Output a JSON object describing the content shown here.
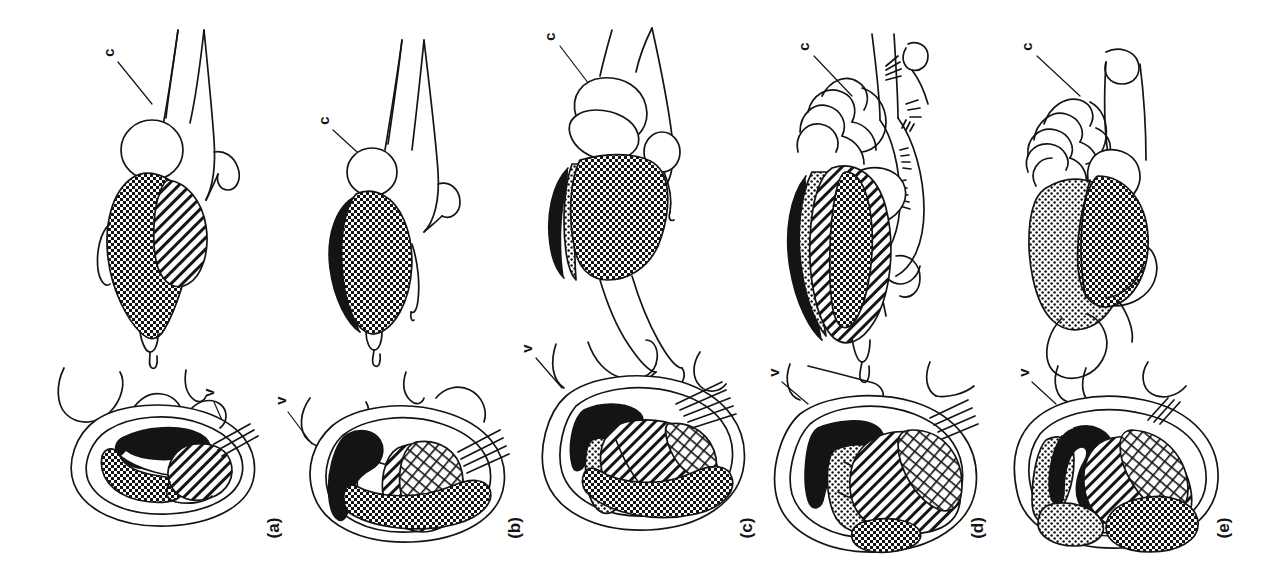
{
  "figure": {
    "kind": "comparative-anatomy-line-drawing",
    "background_color": "#ffffff",
    "ink_color": "#141414",
    "text_rotation_degrees": -90,
    "panel_count": 5
  },
  "legend_keys": {
    "c": "c",
    "v": "v"
  },
  "patterns": {
    "solid": "solid-black",
    "checker": "dense-checkerboard",
    "hatch": "diagonal-hatch",
    "stipple": "dotted-stipple",
    "crosshatch": "fine-crosshatch",
    "blank": "unfilled-white"
  },
  "panels": [
    {
      "id": "a",
      "label": "(a)",
      "label_x": 272,
      "label_y": 528,
      "top_label": {
        "text": "c",
        "x": 110,
        "y": 52
      },
      "bottom_label": {
        "text": "v",
        "x": 210,
        "y": 392
      },
      "fills_top": [
        "checker",
        "hatch",
        "checker",
        "blank"
      ],
      "fills_bottom": [
        "solid",
        "checker",
        "hatch",
        "blank"
      ]
    },
    {
      "id": "b",
      "label": "(b)",
      "label_x": 512,
      "label_y": 528,
      "top_label": {
        "text": "c",
        "x": 325,
        "y": 120
      },
      "bottom_label": {
        "text": "v",
        "x": 282,
        "y": 400
      },
      "fills_top": [
        "solid",
        "checker",
        "blank"
      ],
      "fills_bottom": [
        "solid",
        "checker",
        "crosshatch",
        "hatch",
        "blank"
      ]
    },
    {
      "id": "c",
      "label": "(c)",
      "label_x": 745,
      "label_y": 528,
      "top_label": {
        "text": "c",
        "x": 551,
        "y": 35
      },
      "bottom_label": {
        "text": "v",
        "x": 528,
        "y": 348
      },
      "fills_top": [
        "solid",
        "checker",
        "stipple",
        "blank"
      ],
      "fills_bottom": [
        "solid",
        "stipple",
        "hatch",
        "checker",
        "blank"
      ]
    },
    {
      "id": "d",
      "label": "(d)",
      "label_x": 975,
      "label_y": 528,
      "top_label": {
        "text": "c",
        "x": 805,
        "y": 45
      },
      "bottom_label": {
        "text": "v",
        "x": 775,
        "y": 372
      },
      "fills_top": [
        "solid",
        "stipple",
        "hatch",
        "checker",
        "blank"
      ],
      "fills_bottom": [
        "solid",
        "stipple",
        "hatch",
        "crosshatch",
        "checker",
        "blank"
      ]
    },
    {
      "id": "e",
      "label": "(e)",
      "label_x": 1222,
      "label_y": 528,
      "top_label": {
        "text": "c",
        "x": 1028,
        "y": 45
      },
      "bottom_label": {
        "text": "v",
        "x": 1025,
        "y": 372
      },
      "fills_top": [
        "stipple",
        "checker",
        "blank"
      ],
      "fills_bottom": [
        "solid",
        "stipple",
        "hatch",
        "crosshatch",
        "checker",
        "blank"
      ]
    }
  ]
}
